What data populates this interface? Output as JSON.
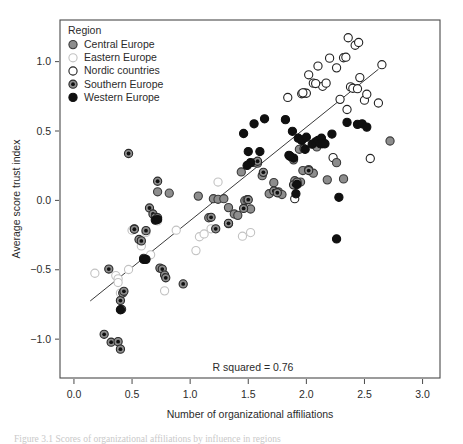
{
  "figure": {
    "caption": "Figure 3.1 Scores of organizational affiliations by influence in regions"
  },
  "chart_data": {
    "type": "scatter",
    "title": "",
    "xlabel": "Number of organizational affiliations",
    "ylabel": "Average score trust index",
    "xlim": [
      -0.12,
      3.15
    ],
    "ylim": [
      -1.28,
      1.3
    ],
    "xticks": [
      "0.0",
      "0.5",
      "1.0",
      "1.5",
      "2.0",
      "2.5",
      "3.0"
    ],
    "xtick_values": [
      0.0,
      0.5,
      1.0,
      1.5,
      2.0,
      2.5,
      3.0
    ],
    "yticks": [
      "−1.0",
      "−0.5",
      "0.0",
      "0.5",
      "1.0"
    ],
    "ytick_values": [
      -1.0,
      -0.5,
      0.0,
      0.5,
      1.0
    ],
    "grid": false,
    "legend_position": "top-left",
    "legend_title": "Region",
    "annotation": "R squared = 0.76",
    "r_squared": 0.76,
    "fit_line": {
      "x0": 0.14,
      "y0": -0.725,
      "x1": 2.62,
      "y1": 0.945
    },
    "marker_styles": {
      "Central Europe": {
        "fill": "#8d8d8d",
        "stroke": "#3a3a3a",
        "center_dot": false
      },
      "Eastern Europe": {
        "fill": "#ffffff",
        "stroke": "#c2c2c2",
        "center_dot": false
      },
      "Nordic countries": {
        "fill": "#ffffff",
        "stroke": "#222222",
        "center_dot": false
      },
      "Southern Europe": {
        "fill": "#8d8d8d",
        "stroke": "#2a2a2a",
        "center_dot": true
      },
      "Western Europe": {
        "fill": "#101010",
        "stroke": "#101010",
        "center_dot": false
      }
    },
    "series": [
      {
        "name": "Central Europe",
        "points": [
          [
            0.52,
            -0.205
          ],
          [
            0.72,
            0.062
          ],
          [
            0.82,
            0.052
          ],
          [
            1.07,
            0.031
          ],
          [
            1.16,
            -0.125
          ],
          [
            1.2,
            0.012
          ],
          [
            1.24,
            0.008
          ],
          [
            1.29,
            0.012
          ],
          [
            1.33,
            -0.052
          ],
          [
            1.38,
            -0.098
          ],
          [
            1.44,
            0.205
          ],
          [
            1.47,
            -0.002
          ],
          [
            1.49,
            0.005
          ],
          [
            1.52,
            -0.062
          ],
          [
            1.56,
            0.272
          ],
          [
            1.58,
            0.268
          ],
          [
            1.62,
            0.178
          ],
          [
            1.68,
            0.048
          ],
          [
            1.72,
            0.128
          ],
          [
            1.76,
            0.062
          ],
          [
            1.79,
            0.042
          ],
          [
            1.86,
            0.318
          ],
          [
            1.9,
            0.142
          ],
          [
            1.94,
            0.368
          ],
          [
            1.97,
            0.215
          ],
          [
            2.02,
            0.222
          ],
          [
            2.06,
            0.196
          ],
          [
            2.12,
            0.418
          ],
          [
            2.14,
            0.408
          ],
          [
            2.18,
            0.148
          ],
          [
            2.26,
            0.272
          ],
          [
            2.32,
            0.155
          ],
          [
            2.72,
            0.428
          ],
          [
            1.95,
            0.132
          ],
          [
            2.09,
            0.385
          ],
          [
            1.89,
            0.292
          ],
          [
            1.33,
            -0.168
          ],
          [
            1.41,
            -0.108
          ]
        ]
      },
      {
        "name": "Eastern Europe",
        "points": [
          [
            0.18,
            -0.525
          ],
          [
            0.36,
            -0.542
          ],
          [
            0.38,
            -0.565
          ],
          [
            0.38,
            -0.592
          ],
          [
            0.4,
            -0.668
          ],
          [
            0.47,
            -0.498
          ],
          [
            0.5,
            -0.215
          ],
          [
            0.58,
            -0.328
          ],
          [
            0.66,
            -0.392
          ],
          [
            0.72,
            -0.148
          ],
          [
            0.78,
            -0.652
          ],
          [
            1.05,
            -0.362
          ],
          [
            1.08,
            -0.262
          ],
          [
            1.12,
            -0.242
          ],
          [
            1.18,
            -0.205
          ],
          [
            1.24,
            0.132
          ],
          [
            1.45,
            -0.258
          ],
          [
            1.52,
            -0.232
          ],
          [
            0.88,
            -0.215
          ],
          [
            0.62,
            -0.232
          ]
        ]
      },
      {
        "name": "Nordic countries",
        "points": [
          [
            1.84,
            0.742
          ],
          [
            1.9,
            0.012
          ],
          [
            1.96,
            0.768
          ],
          [
            1.98,
            0.775
          ],
          [
            2.0,
            0.772
          ],
          [
            2.02,
            0.905
          ],
          [
            2.06,
            0.845
          ],
          [
            2.1,
            0.968
          ],
          [
            2.14,
            0.822
          ],
          [
            2.17,
            0.845
          ],
          [
            2.2,
            1.025
          ],
          [
            2.26,
            0.955
          ],
          [
            2.29,
            0.728
          ],
          [
            2.32,
            1.028
          ],
          [
            2.34,
            1.032
          ],
          [
            2.35,
            0.655
          ],
          [
            2.36,
            1.172
          ],
          [
            2.38,
            0.818
          ],
          [
            2.4,
            0.808
          ],
          [
            2.42,
            1.118
          ],
          [
            2.45,
            1.138
          ],
          [
            2.46,
            0.885
          ],
          [
            2.5,
            0.722
          ],
          [
            2.52,
            0.765
          ],
          [
            2.55,
            0.302
          ],
          [
            2.62,
            0.702
          ],
          [
            2.65,
            0.978
          ],
          [
            2.23,
            0.308
          ],
          [
            2.08,
            0.842
          ],
          [
            1.97,
            0.775
          ],
          [
            2.44,
            0.805
          ]
        ]
      },
      {
        "name": "Southern Europe",
        "points": [
          [
            0.3,
            -0.495
          ],
          [
            0.26,
            -0.965
          ],
          [
            0.32,
            -1.022
          ],
          [
            0.38,
            -1.018
          ],
          [
            0.4,
            -1.072
          ],
          [
            0.4,
            -0.722
          ],
          [
            0.41,
            -0.785
          ],
          [
            0.42,
            -0.668
          ],
          [
            0.43,
            -0.655
          ],
          [
            0.47,
            0.338
          ],
          [
            0.52,
            -0.208
          ],
          [
            0.56,
            -0.282
          ],
          [
            0.58,
            -0.292
          ],
          [
            0.6,
            -0.418
          ],
          [
            0.65,
            -0.055
          ],
          [
            0.68,
            -0.098
          ],
          [
            0.7,
            -0.122
          ],
          [
            0.72,
            -0.125
          ],
          [
            0.72,
            0.138
          ],
          [
            0.74,
            -0.488
          ],
          [
            0.76,
            -0.495
          ],
          [
            0.78,
            -0.538
          ],
          [
            0.79,
            -0.558
          ],
          [
            0.94,
            -0.602
          ],
          [
            1.18,
            -0.122
          ],
          [
            1.22,
            -0.205
          ],
          [
            1.33,
            -0.165
          ],
          [
            1.46,
            -0.058
          ],
          [
            1.5,
            0.005
          ],
          [
            1.58,
            0.282
          ],
          [
            1.63,
            0.202
          ],
          [
            1.72,
            0.068
          ],
          [
            1.89,
            0.112
          ],
          [
            1.92,
            0.132
          ],
          [
            1.98,
            0.372
          ],
          [
            2.02,
            0.215
          ],
          [
            1.75,
            0.055
          ],
          [
            0.62,
            -0.218
          ]
        ]
      },
      {
        "name": "Western Europe",
        "points": [
          [
            0.4,
            -0.788
          ],
          [
            0.6,
            -0.425
          ],
          [
            0.62,
            -0.425
          ],
          [
            0.7,
            -0.142
          ],
          [
            0.72,
            -0.138
          ],
          [
            1.46,
            0.482
          ],
          [
            1.5,
            0.352
          ],
          [
            1.52,
            0.272
          ],
          [
            1.55,
            0.552
          ],
          [
            1.6,
            0.352
          ],
          [
            1.64,
            0.588
          ],
          [
            1.49,
            0.252
          ],
          [
            1.82,
            0.582
          ],
          [
            1.85,
            0.325
          ],
          [
            1.88,
            0.498
          ],
          [
            1.89,
            0.305
          ],
          [
            1.92,
            0.115
          ],
          [
            1.93,
            0.448
          ],
          [
            1.96,
            0.432
          ],
          [
            2.0,
            0.455
          ],
          [
            2.05,
            0.405
          ],
          [
            2.08,
            0.422
          ],
          [
            2.1,
            0.432
          ],
          [
            2.12,
            0.408
          ],
          [
            2.13,
            0.448
          ],
          [
            2.14,
            0.412
          ],
          [
            2.16,
            0.408
          ],
          [
            2.22,
            0.478
          ],
          [
            2.35,
            0.562
          ],
          [
            2.44,
            0.548
          ],
          [
            2.48,
            0.552
          ],
          [
            2.52,
            0.528
          ],
          [
            2.26,
            -0.278
          ],
          [
            2.28,
            0.022
          ],
          [
            1.91,
            0.048
          ],
          [
            1.99,
            0.368
          ],
          [
            1.86,
            0.318
          ]
        ]
      }
    ]
  }
}
